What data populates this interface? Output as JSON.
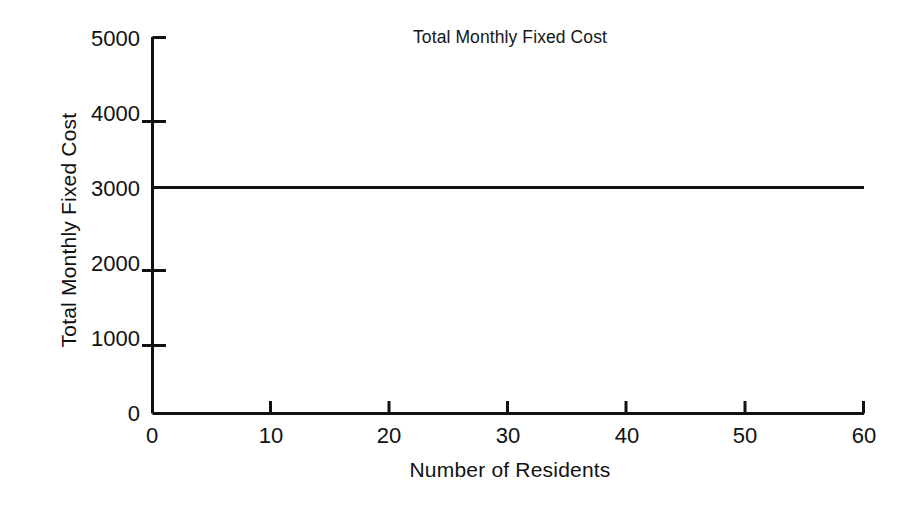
{
  "chart_data": {
    "type": "line",
    "title": "Total Monthly Fixed Cost",
    "xlabel": "Number of Residents",
    "ylabel": "Total Monthly Fixed Cost",
    "xlim": [
      0,
      60
    ],
    "ylim": [
      0,
      5000
    ],
    "xticks": [
      0,
      10,
      20,
      30,
      40,
      50,
      60
    ],
    "yticks": [
      0,
      1000,
      2000,
      3000,
      4000,
      5000
    ],
    "xtick_labels": [
      "0",
      "10",
      "20",
      "30",
      "40",
      "50",
      "60"
    ],
    "ytick_labels": [
      "0",
      "1000",
      "2000",
      "3000",
      "4000",
      "5000"
    ],
    "grid": false,
    "legend": false,
    "series": [
      {
        "name": "Total Monthly Fixed Cost",
        "color": "#111111",
        "x": [
          0,
          10,
          20,
          30,
          40,
          50,
          60
        ],
        "values": [
          3000,
          3000,
          3000,
          3000,
          3000,
          3000,
          3000
        ]
      }
    ],
    "annotations": []
  }
}
